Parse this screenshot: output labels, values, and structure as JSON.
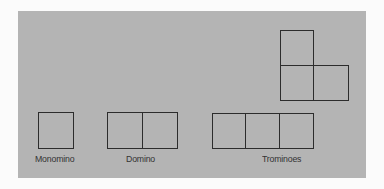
{
  "diagram": {
    "background_color": "#b4b4b4",
    "line_color": "#2c2c2c",
    "pieces": [
      {
        "name": "Monomino",
        "label": "Monomino",
        "cells": 1
      },
      {
        "name": "Domino",
        "label": "Domino",
        "cells": 2
      },
      {
        "name": "Straight tromino",
        "cells": 3
      },
      {
        "name": "L tromino",
        "cells": 3
      }
    ],
    "labels": {
      "monomino": "Monomino",
      "domino": "Domino",
      "trominoes": "Trominoes"
    }
  }
}
